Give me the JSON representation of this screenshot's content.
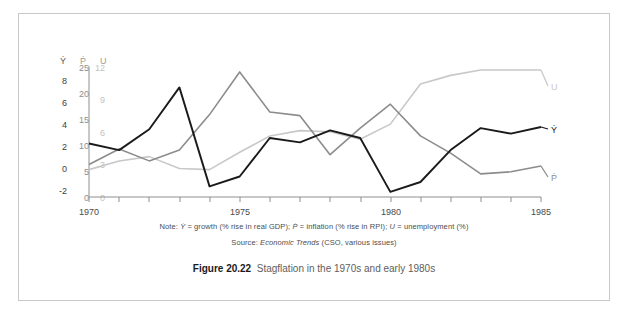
{
  "figure": {
    "caption_label": "Figure 20.22",
    "caption_text": "Stagflation in the 1970s and early 1980s",
    "note_prefix": "Note: ",
    "note_y": "Ẏ",
    "note_y_desc": " = growth (% rise in real GDP); ",
    "note_p": "Ṗ",
    "note_p_desc": " = inflation (% rise in RPI); ",
    "note_u": "U",
    "note_u_desc": " = unemployment (%)",
    "source_prefix": "Source: ",
    "source_italic": "Economic Trends",
    "source_suffix": " (CSO, various issues)"
  },
  "chart_data": {
    "type": "line",
    "title": "Stagflation in the 1970s and early 1980s",
    "xlabel": "",
    "x": [
      1970,
      1971,
      1972,
      1973,
      1974,
      1975,
      1976,
      1977,
      1978,
      1979,
      1980,
      1981,
      1982,
      1983,
      1984,
      1985
    ],
    "xlim": [
      1970,
      1985
    ],
    "x_tick_labels": [
      "1970",
      "1975",
      "1980",
      "1985"
    ],
    "x_tick_values": [
      1970,
      1975,
      1980,
      1985
    ],
    "grid": false,
    "legend_position": "right-edge-inline",
    "axes": [
      {
        "name": "Y",
        "symbol": "Ẏ",
        "label": "growth (% rise in real GDP)",
        "ticks": [
          8,
          6,
          4,
          2,
          0,
          -2
        ],
        "ylim": [
          -2.6,
          9.0
        ],
        "color": "#1a1a1a"
      },
      {
        "name": "P",
        "symbol": "Ṗ",
        "label": "inflation (% rise in RPI)",
        "ticks": [
          25,
          20,
          15,
          10,
          5,
          0
        ],
        "ylim": [
          0,
          25
        ],
        "color": "#8c8c8c"
      },
      {
        "name": "U",
        "symbol": "U",
        "label": "unemployment (%)",
        "ticks": [
          12,
          9,
          6,
          3,
          0
        ],
        "ylim": [
          0,
          12
        ],
        "color": "#c8c8c8"
      }
    ],
    "series": [
      {
        "name": "Ẏ",
        "axis": "Y",
        "color": "#1a1a1a",
        "values": [
          2.3,
          1.7,
          3.6,
          7.4,
          -1.6,
          -0.7,
          2.8,
          2.4,
          3.5,
          2.8,
          -2.1,
          -1.2,
          1.7,
          3.7,
          3.2,
          3.8
        ]
      },
      {
        "name": "Ṗ",
        "axis": "P",
        "color": "#8c8c8c",
        "values": [
          6.4,
          9.4,
          7.1,
          9.2,
          16.0,
          24.2,
          16.5,
          15.8,
          8.3,
          13.4,
          18.0,
          11.9,
          8.6,
          4.6,
          5.0,
          6.1
        ]
      },
      {
        "name": "U",
        "axis": "U",
        "color": "#c8c8c8",
        "values": [
          2.6,
          3.4,
          3.8,
          2.7,
          2.6,
          4.2,
          5.7,
          6.2,
          6.1,
          5.4,
          6.8,
          10.5,
          11.3,
          11.8,
          11.8,
          11.8
        ]
      }
    ]
  }
}
